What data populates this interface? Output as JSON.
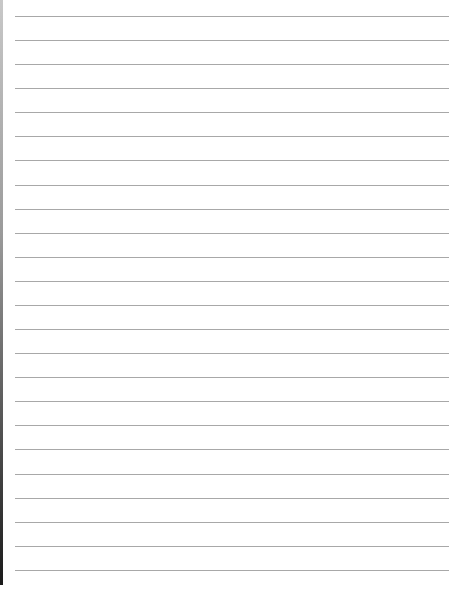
{
  "page": {
    "type": "lined-paper",
    "background": "#ffffff",
    "line_color": "#a8a8a8",
    "edge_color": "#1a1a1a",
    "line_count": 24,
    "first_line_y": 16,
    "line_spacing": 24.08,
    "line_left": 15,
    "line_right": 449
  }
}
